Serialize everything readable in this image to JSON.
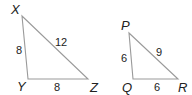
{
  "diagram": {
    "type": "similar-triangles",
    "triangles": [
      {
        "name": "XYZ",
        "vertices": {
          "X": {
            "label": "X",
            "x": 22,
            "y": 16
          },
          "Y": {
            "label": "Y",
            "x": 28,
            "y": 79
          },
          "Z": {
            "label": "Z",
            "x": 88,
            "y": 79
          }
        },
        "sides": {
          "XY": "8",
          "XZ": "12",
          "YZ": "8"
        }
      },
      {
        "name": "PQR",
        "vertices": {
          "P": {
            "label": "P",
            "x": 129,
            "y": 33
          },
          "Q": {
            "label": "Q",
            "x": 133,
            "y": 79
          },
          "R": {
            "label": "R",
            "x": 178,
            "y": 79
          }
        },
        "sides": {
          "PQ": "6",
          "PR": "9",
          "QR": "6"
        }
      }
    ],
    "colors": {
      "edge": "#9a9a9a",
      "text": "#222222",
      "background": "#ffffff"
    }
  }
}
